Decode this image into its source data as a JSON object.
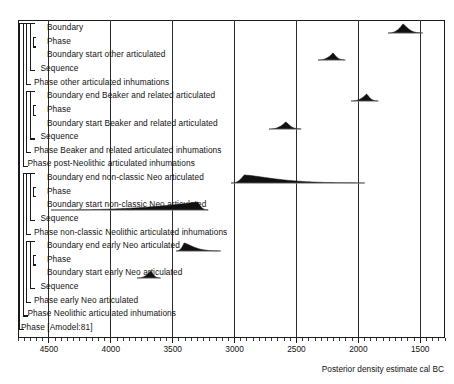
{
  "chart_data": {
    "type": "area",
    "title": "",
    "xlabel": "Posterior density estimate cal BC",
    "ylabel": "",
    "xlim": [
      4750,
      1300
    ],
    "x_direction": "reversed",
    "grid": true,
    "legend": "none",
    "axis": {
      "major_ticks": [
        4500,
        4000,
        3500,
        3000,
        2500,
        2000,
        1500
      ],
      "tick_labels": [
        "4500",
        "4000",
        "3500",
        "3000",
        "2500",
        "2000",
        "1500"
      ],
      "minor_tick_step": 50,
      "units": "cal BC"
    },
    "rows": [
      {
        "index": 0,
        "label": "Boundary",
        "depth": 4,
        "kind": "boundary",
        "distribution": {
          "mode": 1640,
          "start": 1760,
          "end": 1480,
          "skew": "right-tail",
          "height": 9
        }
      },
      {
        "index": 1,
        "label": "Phase",
        "depth": 4,
        "kind": "phase",
        "distribution": null
      },
      {
        "index": 2,
        "label": "Boundary start other articulated",
        "depth": 4,
        "kind": "boundary",
        "distribution": {
          "mode": 2210,
          "start": 2330,
          "end": 2110,
          "skew": "symmetric",
          "height": 7
        }
      },
      {
        "index": 3,
        "label": "Sequence",
        "depth": 3,
        "kind": "sequence",
        "distribution": null
      },
      {
        "index": 4,
        "label": "Phase other articulated inhumations",
        "depth": 2,
        "kind": "phase",
        "distribution": null
      },
      {
        "index": 5,
        "label": "Boundary end Beaker and related articulated",
        "depth": 4,
        "kind": "boundary",
        "distribution": {
          "mode": 1935,
          "start": 2060,
          "end": 1840,
          "skew": "symmetric",
          "height": 7
        }
      },
      {
        "index": 6,
        "label": "Phase",
        "depth": 4,
        "kind": "phase",
        "distribution": null
      },
      {
        "index": 7,
        "label": "Boundary start Beaker and related articulated",
        "depth": 4,
        "kind": "boundary",
        "distribution": {
          "mode": 2585,
          "start": 2720,
          "end": 2460,
          "skew": "symmetric",
          "height": 7
        }
      },
      {
        "index": 8,
        "label": "Sequence",
        "depth": 3,
        "kind": "sequence",
        "distribution": null
      },
      {
        "index": 9,
        "label": "Phase Beaker and related articulated inhumations",
        "depth": 2,
        "kind": "phase",
        "distribution": null
      },
      {
        "index": 10,
        "label": "Phase post-Neolithic articulated inhumations",
        "depth": 1,
        "kind": "phase",
        "distribution": null
      },
      {
        "index": 11,
        "label": "Boundary end non-classic Neo articulated",
        "depth": 4,
        "kind": "boundary",
        "distribution": {
          "mode": 2925,
          "start": 3030,
          "end": 1950,
          "skew": "long-right-tail",
          "height": 8
        }
      },
      {
        "index": 12,
        "label": "Phase",
        "depth": 4,
        "kind": "phase",
        "distribution": null
      },
      {
        "index": 13,
        "label": "Boundary start non-classic Neo articulated",
        "depth": 4,
        "kind": "boundary",
        "distribution": {
          "mode": 3295,
          "start": 4480,
          "end": 3210,
          "skew": "long-left-tail",
          "height": 8
        }
      },
      {
        "index": 14,
        "label": "Sequence",
        "depth": 3,
        "kind": "sequence",
        "distribution": null
      },
      {
        "index": 15,
        "label": "Phase non-classic Neolithic articulated inhumations",
        "depth": 2,
        "kind": "phase",
        "distribution": null
      },
      {
        "index": 16,
        "label": "Boundary end early Neo articulated",
        "depth": 4,
        "kind": "boundary",
        "distribution": {
          "mode": 3405,
          "start": 3470,
          "end": 3110,
          "skew": "right-tail",
          "height": 8
        }
      },
      {
        "index": 17,
        "label": "Phase",
        "depth": 4,
        "kind": "phase",
        "distribution": null
      },
      {
        "index": 18,
        "label": "Boundary start early Neo articulated",
        "depth": 4,
        "kind": "boundary",
        "distribution": {
          "mode": 3680,
          "start": 3790,
          "end": 3600,
          "skew": "symmetric",
          "height": 7
        }
      },
      {
        "index": 19,
        "label": "Sequence",
        "depth": 3,
        "kind": "sequence",
        "distribution": null
      },
      {
        "index": 20,
        "label": "Phase early Neo articulated",
        "depth": 2,
        "kind": "phase",
        "distribution": null
      },
      {
        "index": 21,
        "label": "Phase Neolithic articulated inhumations",
        "depth": 1,
        "kind": "phase",
        "distribution": null
      },
      {
        "index": 22,
        "label": "Phase [Amodel:81]",
        "depth": 0,
        "kind": "phase",
        "distribution": null
      }
    ]
  },
  "caption": "Posterior density estimate cal BC",
  "colors": {
    "frame": "#1a1a1a",
    "grid": "#2b2b2b",
    "distribution_fill": "#111111",
    "distribution_tail": "#9a9a9a",
    "text": "#111111",
    "background": "#ffffff"
  }
}
